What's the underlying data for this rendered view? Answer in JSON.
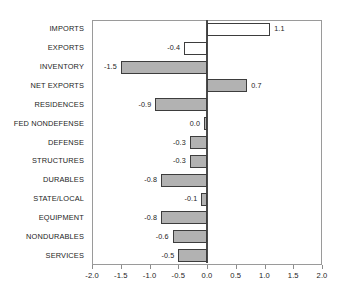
{
  "chart_data": {
    "type": "bar",
    "orientation": "horizontal",
    "title": "",
    "subtitle": "",
    "xlabel": "",
    "ylabel": "",
    "xlim": [
      -2.0,
      2.0
    ],
    "xticks": [
      "-2.0",
      "-1.5",
      "-1.0",
      "-0.5",
      "0.0",
      "0.5",
      "1.0",
      "1.5",
      "2.0"
    ],
    "xtick_values": [
      -2.0,
      -1.5,
      -1.0,
      -0.5,
      0.0,
      0.5,
      1.0,
      1.5,
      2.0
    ],
    "grid": false,
    "legend": null,
    "legend_position": "none",
    "zero_reference_line": true,
    "categories": [
      "IMPORTS",
      "EXPORTS",
      "INVENTORY",
      "NET EXPORTS",
      "RESIDENCES",
      "FED NONDEFENSE",
      "DEFENSE",
      "STRUCTURES",
      "DURABLES",
      "STATE/LOCAL",
      "EQUIPMENT",
      "NONDURABLES",
      "SERVICES"
    ],
    "values": [
      1.1,
      -0.4,
      -1.5,
      0.7,
      -0.9,
      0.0,
      -0.3,
      -0.3,
      -0.8,
      -0.1,
      -0.8,
      -0.6,
      -0.5
    ],
    "data_labels": [
      "1.1",
      "-0.4",
      "-1.5",
      "0.7",
      "-0.9",
      "0.0",
      "-0.3",
      "-0.3",
      "-0.8",
      "-0.1",
      "-0.8",
      "-0.6",
      "-0.5"
    ],
    "bar_styles": [
      "hollow",
      "hollow",
      "filled",
      "filled",
      "filled",
      "filled",
      "filled",
      "filled",
      "filled",
      "filled",
      "filled",
      "filled",
      "filled"
    ],
    "colors": {
      "bar_fill": "#b2b2b2",
      "bar_fill_hollow": "#ffffff",
      "bar_edge": "#3d3d3d",
      "axis": "#9a9a9a",
      "zero_line": "#4a4a4a",
      "text": "#1c1c1c",
      "background": "#ffffff"
    }
  }
}
